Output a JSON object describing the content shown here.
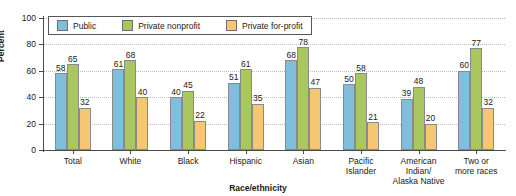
{
  "chart_data": {
    "type": "bar",
    "title": "",
    "xlabel": "Race/ethnicity",
    "ylabel": "Percent",
    "ylim": [
      0,
      100
    ],
    "yticks": [
      0,
      20,
      40,
      60,
      80,
      100
    ],
    "grid": true,
    "legend_position": "top-left-inside",
    "categories": [
      "Total",
      "White",
      "Black",
      "Hispanic",
      "Asian",
      "Pacific Islander",
      "American Indian/ Alaska Native",
      "Two or more races"
    ],
    "category_lines": [
      [
        "Total"
      ],
      [
        "White"
      ],
      [
        "Black"
      ],
      [
        "Hispanic"
      ],
      [
        "Asian"
      ],
      [
        "Pacific",
        "Islander"
      ],
      [
        "American",
        "Indian/",
        "Alaska Native"
      ],
      [
        "Two or",
        "more races"
      ]
    ],
    "series": [
      {
        "name": "Public",
        "color": "#7fbedd",
        "values": [
          58,
          61,
          40,
          51,
          68,
          50,
          39,
          60
        ]
      },
      {
        "name": "Private nonprofit",
        "color": "#a9c75e",
        "values": [
          65,
          68,
          45,
          61,
          78,
          58,
          48,
          77
        ]
      },
      {
        "name": "Private for-profit",
        "color": "#f6c772",
        "values": [
          32,
          40,
          22,
          35,
          47,
          21,
          20,
          32
        ]
      }
    ]
  }
}
